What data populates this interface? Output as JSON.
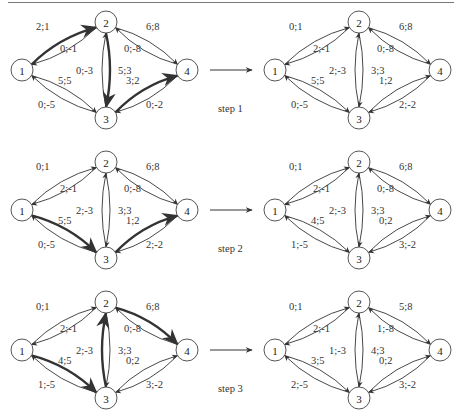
{
  "figure": {
    "steps": [
      {
        "label": "step 1",
        "before": {
          "edges": {
            "e12": "2;1",
            "e21": "0;-1",
            "e13": "5;5",
            "e31": "0;-5",
            "e23": "5;3",
            "e32": "0;-3",
            "e24": "6;8",
            "e42": "0;-8",
            "e34": "3;2",
            "e43": "0;-2"
          },
          "bold": [
            "e12",
            "e23",
            "e34"
          ]
        },
        "after": {
          "edges": {
            "e12": "0;1",
            "e21": "2;-1",
            "e13": "5;5",
            "e31": "0;-5",
            "e23": "3;3",
            "e32": "2;-3",
            "e24": "6;8",
            "e42": "0;-8",
            "e34": "1;2",
            "e43": "2;-2"
          }
        }
      },
      {
        "label": "step 2",
        "before": {
          "edges": {
            "e12": "0;1",
            "e21": "2;-1",
            "e13": "5;5",
            "e31": "0;-5",
            "e23": "3;3",
            "e32": "2;-3",
            "e24": "6;8",
            "e42": "0;-8",
            "e34": "1;2",
            "e43": "2;-2"
          },
          "bold": [
            "e13",
            "e34"
          ]
        },
        "after": {
          "edges": {
            "e12": "0;1",
            "e21": "2;-1",
            "e13": "4;5",
            "e31": "1;-5",
            "e23": "3;3",
            "e32": "2;-3",
            "e24": "6;8",
            "e42": "0;-8",
            "e34": "0;2",
            "e43": "3;-2"
          }
        }
      },
      {
        "label": "step 3",
        "before": {
          "edges": {
            "e12": "0;1",
            "e21": "2;-1",
            "e13": "4;5",
            "e31": "1;-5",
            "e23": "3;3",
            "e32": "2;-3",
            "e24": "6;8",
            "e42": "0;-8",
            "e34": "0;2",
            "e43": "3;-2"
          },
          "bold": [
            "e13",
            "e32",
            "e24"
          ]
        },
        "after": {
          "edges": {
            "e12": "0;1",
            "e21": "2;-1",
            "e13": "3;5",
            "e31": "2;-5",
            "e23": "4;3",
            "e32": "1;-3",
            "e24": "5;8",
            "e42": "1;-8",
            "e34": "0;2",
            "e43": "3;-2"
          }
        }
      }
    ],
    "node_labels": [
      "1",
      "2",
      "3",
      "4"
    ],
    "colors": {
      "stroke": "#333333",
      "background": "#ffffff"
    }
  }
}
